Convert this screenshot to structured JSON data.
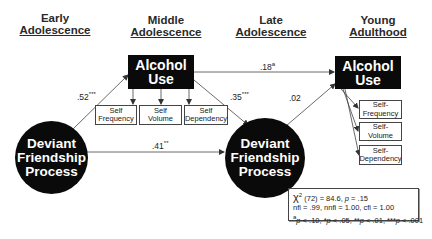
{
  "stages": [
    {
      "line1": "Early",
      "line2": "Adolescence"
    },
    {
      "line1": "Middle",
      "line2": "Adolescence"
    },
    {
      "line1": "Late",
      "line2": "Adolescence"
    },
    {
      "line1": "Young",
      "line2": "Adulthood"
    }
  ],
  "nodes": {
    "alcohol_middle": {
      "line1": "Alcohol",
      "line2": "Use"
    },
    "alcohol_young": {
      "line1": "Alcohol",
      "line2": "Use"
    },
    "deviant_early": {
      "line1": "Deviant",
      "line2": "Friendship",
      "line3": "Process"
    },
    "deviant_late": {
      "line1": "Deviant",
      "line2": "Friendship",
      "line3": "Process"
    }
  },
  "indicators_middle": [
    {
      "line1": "Self",
      "line2": "Frequency"
    },
    {
      "line1": "Self",
      "line2": "Volume"
    },
    {
      "line1": "Self",
      "line2": "Dependency"
    }
  ],
  "indicators_young": [
    {
      "line1": "Self-",
      "line2": "Frequency"
    },
    {
      "line1": "Self-",
      "line2": "Volume"
    },
    {
      "line1": "Self-",
      "line2": "Dependency"
    }
  ],
  "paths": {
    "early_dev_to_mid_alc": {
      "value": ".52",
      "sig": "***"
    },
    "mid_alc_to_young_alc": {
      "value": ".18",
      "sig": "a"
    },
    "mid_alc_to_late_dev": {
      "value": ".35",
      "sig": "***"
    },
    "late_dev_to_young_alc": {
      "value": ".02",
      "sig": ""
    },
    "early_dev_to_late_dev": {
      "value": ".41",
      "sig": "**"
    }
  },
  "stats": {
    "chi_symbol": "χ",
    "chi_sup": "2",
    "line1_rest": " (72) = 84.6, ",
    "p_label": "p",
    "p_value": " = .15",
    "line2": "nfi = .99, nnfi = 1.00, cfi = 1.00",
    "legend_a": "a",
    "legend_rest_1": "p",
    "legend_rest_2": " < .10, *",
    "legend_rest_3": "p",
    "legend_rest_4": " < .05, **",
    "legend_rest_5": "p",
    "legend_rest_6": " < .01, ***",
    "legend_rest_7": "p",
    "legend_rest_8": " < .001"
  },
  "colors": {
    "node_fill": "#0a0a0a",
    "node_text": "#ffffff",
    "line": "#333333"
  }
}
